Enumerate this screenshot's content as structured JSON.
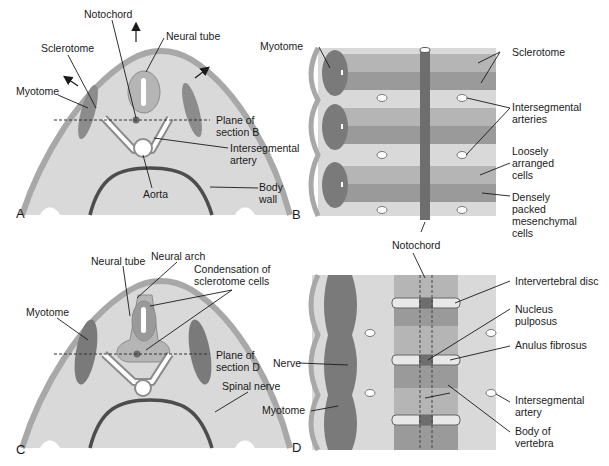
{
  "panels": {
    "A": {
      "letter": "A",
      "labels": {
        "notochord": "Notochord",
        "neural_tube": "Neural tube",
        "sclerotome": "Sclerotome",
        "myotome": "Myotome",
        "plane_1": "Plane of",
        "plane_2": "section B",
        "interseg_1": "Intersegmental",
        "interseg_2": "artery",
        "aorta": "Aorta",
        "body_1": "Body",
        "body_2": "wall"
      }
    },
    "B": {
      "letter": "B",
      "labels": {
        "myotome": "Myotome",
        "sclerotome": "Sclerotome",
        "interseg_1": "Intersegmental",
        "interseg_2": "arteries",
        "loose_1": "Loosely",
        "loose_2": "arranged",
        "loose_3": "cells",
        "dense_1": "Densely",
        "dense_2": "packed",
        "dense_3": "mesenchymal",
        "dense_4": "cells",
        "notochord": "Notochord"
      }
    },
    "C": {
      "letter": "C",
      "labels": {
        "neural_tube": "Neural tube",
        "neural_arch": "Neural arch",
        "cond_1": "Condensation of",
        "cond_2": "sclerotome cells",
        "myotome": "Myotome",
        "plane_1": "Plane of",
        "plane_2": "section D",
        "spinal_nerve": "Spinal nerve"
      }
    },
    "D": {
      "letter": "D",
      "labels": {
        "ivd": "Intervertebral disc",
        "np_1": "Nucleus",
        "np_2": "pulposus",
        "af": "Anulus fibrosus",
        "nerve": "Nerve",
        "myotome": "Myotome",
        "interseg_1": "Intersegmental",
        "interseg_2": "artery",
        "body_1": "Body of",
        "body_2": "vertebra"
      }
    }
  },
  "colors": {
    "tissue_light": "#d9d9d9",
    "tissue_mid": "#b5b5b5",
    "tissue_dark": "#8c8c8c",
    "muscle": "#7a7a7a",
    "outline": "#4d4d4d",
    "skin": "#a8a8a8"
  }
}
